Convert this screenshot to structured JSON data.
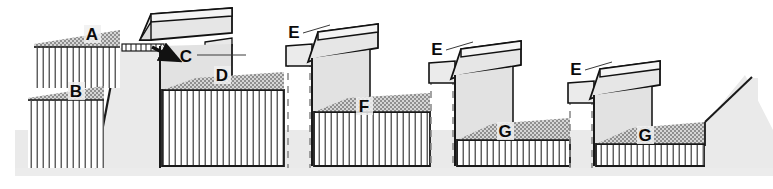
{
  "figure": {
    "type": "engineering-cross-section",
    "title": "",
    "width": 773,
    "height": 189,
    "background": "#ffffff"
  },
  "palette": {
    "outline": "#1a1a1a",
    "stipple_band": "#9a9a9a",
    "hatch_line": "#2b2b2b",
    "ground_mass": "#eaeaea",
    "beam_face": "#e6e6e6",
    "beam_top": "#f2f2f2",
    "wall_face": "#e2e2e2",
    "post_face": "#ebebeb",
    "dashed_pile": "#8c8c8c",
    "label_halo": "#f0f0f0",
    "label_text": "#0a0a0a"
  },
  "labels": [
    {
      "id": "A",
      "text": "A",
      "x": 92,
      "y": 38,
      "role": "upper-terrace-surface"
    },
    {
      "id": "B",
      "text": "B",
      "x": 76,
      "y": 95,
      "role": "lower-terrace-surface"
    },
    {
      "id": "C",
      "text": "C",
      "x": 186,
      "y": 60,
      "role": "anchor-point-arrow-target"
    },
    {
      "id": "D",
      "text": "D",
      "x": 222,
      "y": 79,
      "role": "terrace-fill-1"
    },
    {
      "id": "E1",
      "text": "E",
      "x": 294,
      "y": 36,
      "role": "post-cap-1"
    },
    {
      "id": "F",
      "text": "F",
      "x": 364,
      "y": 110,
      "role": "terrace-fill-2"
    },
    {
      "id": "E2",
      "text": "E",
      "x": 437,
      "y": 53,
      "role": "post-cap-2"
    },
    {
      "id": "G1",
      "text": "G",
      "x": 505,
      "y": 135,
      "role": "terrace-fill-3"
    },
    {
      "id": "E3",
      "text": "E",
      "x": 576,
      "y": 73,
      "role": "post-cap-3"
    },
    {
      "id": "G2",
      "text": "G",
      "x": 645,
      "y": 135,
      "role": "terrace-fill-4"
    }
  ],
  "annotations": {
    "arrow": {
      "name": "force-arrow-c",
      "from_x": 152,
      "from_y": 48,
      "to_x": 180,
      "to_y": 62,
      "direction": "down-right"
    },
    "leaders": [
      {
        "name": "leader-c",
        "x1": 196,
        "y1": 55,
        "x2": 246,
        "y2": 55
      },
      {
        "name": "leader-e1",
        "x1": 303,
        "y1": 33,
        "x2": 330,
        "y2": 24
      },
      {
        "name": "leader-e2",
        "x1": 446,
        "y1": 50,
        "x2": 473,
        "y2": 41
      },
      {
        "name": "leader-e3",
        "x1": 585,
        "y1": 70,
        "x2": 612,
        "y2": 61
      }
    ]
  },
  "terraces": [
    {
      "name": "terrace-upper-left",
      "surface_label": "A",
      "hatch": true,
      "stipple": true
    },
    {
      "name": "terrace-lower-left",
      "surface_label": "B",
      "hatch": true,
      "stipple": true
    },
    {
      "name": "terrace-fill-d",
      "surface_label": "D",
      "hatch": true,
      "stipple": true
    },
    {
      "name": "terrace-fill-f",
      "surface_label": "F",
      "hatch": true,
      "stipple": true
    },
    {
      "name": "terrace-fill-g1",
      "surface_label": "G",
      "hatch": true,
      "stipple": true
    },
    {
      "name": "terrace-fill-g2",
      "surface_label": "G",
      "hatch": true,
      "stipple": true
    }
  ],
  "structures": [
    {
      "name": "beam-unit-1",
      "post_label": "",
      "has_dashed_pile": false,
      "beam": "horizontal"
    },
    {
      "name": "beam-unit-2",
      "post_label": "E",
      "has_dashed_pile": true,
      "beam": "inclined"
    },
    {
      "name": "beam-unit-3",
      "post_label": "E",
      "has_dashed_pile": true,
      "beam": "inclined"
    },
    {
      "name": "beam-unit-4",
      "post_label": "E",
      "has_dashed_pile": true,
      "beam": "inclined"
    }
  ]
}
